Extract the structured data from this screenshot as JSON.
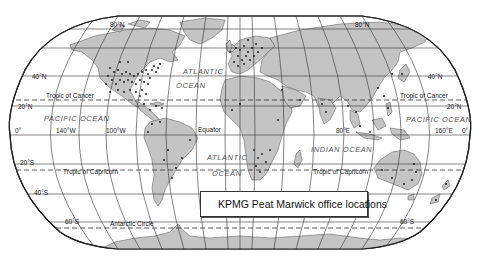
{
  "map": {
    "projection": "Robinson",
    "title": "",
    "colors": {
      "land": "#c4c4c4",
      "ocean": "#ffffff",
      "grid": "#333333",
      "office_dot": "#111111"
    },
    "parallels": {
      "n80": "80°N",
      "n40_left": "40°N",
      "n40_right": "40°N",
      "n20_left": "20°N",
      "n20_right": "20°N",
      "equator_left": "0°",
      "equator_right": "0°",
      "s20": "20°S",
      "s40": "40°S",
      "s60_left": "60°S",
      "s60_right": "60°S",
      "n80_right": "80°N"
    },
    "meridians": {
      "w140": "140°W",
      "w100": "100°W",
      "e80": "80°E",
      "e160": "160°E"
    },
    "lines": {
      "tropic_cancer_left": "Tropic of Cancer",
      "tropic_cancer_right": "Tropic of Cancer",
      "equator": "Equator",
      "tropic_capricorn_left": "Tropic of Capricorn",
      "tropic_capricorn_right": "Tropic of Capricorn",
      "antarctic_circle": "Antarctic Circle"
    },
    "oceans": {
      "atlantic_north_1": "ATLANTIC",
      "atlantic_north_2": "OCEAN",
      "pacific_left": "PACIFIC OCEAN",
      "pacific_right": "PACIFIC OCEAN",
      "atlantic_south_1": "ATLANTIC",
      "atlantic_south_2": "OCEAN",
      "indian": "INDIAN OCEAN"
    }
  },
  "legend": {
    "symbol": "dot",
    "label": "KPMG Peat Marwick office locations"
  }
}
